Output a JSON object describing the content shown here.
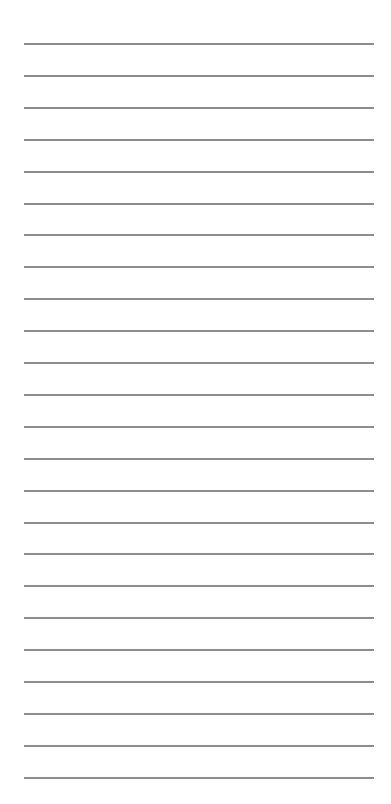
{
  "page": {
    "type": "lined-paper",
    "background_color": "#ffffff",
    "line_color": "#8c8c8c",
    "line_count": 24,
    "first_line_y": 43,
    "line_spacing": 31.9,
    "line_left": 24,
    "line_right": 374
  }
}
